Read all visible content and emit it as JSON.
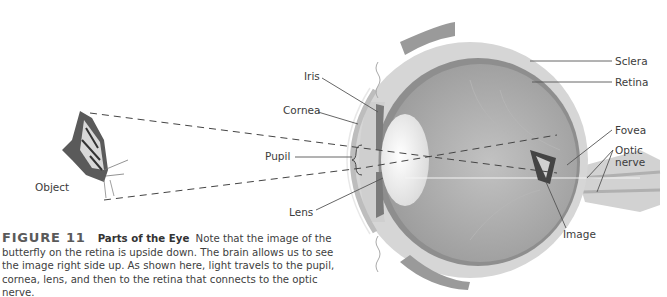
{
  "figure": {
    "number": "FIGURE 11",
    "title": "Parts of the Eye",
    "caption": "Note that the image of the butterfly on the retina is upside down. The brain allows us to see the image right side up. As shown here, light travels to the pupil, cornea, lens, and then to the retina that connects to the optic nerve."
  },
  "labels": {
    "object": "Object",
    "iris": "Iris",
    "cornea": "Cornea",
    "pupil": "Pupil",
    "lens": "Lens",
    "sclera": "Sclera",
    "retina": "Retina",
    "fovea": "Fovea",
    "optic_nerve_line1": "Optic",
    "optic_nerve_line2": "nerve",
    "image": "Image"
  },
  "colors": {
    "sclera": "#d4d4d4",
    "interior": "#a8a8a8",
    "retina_band": "#8c8c8c",
    "lens": "#efefef",
    "leader_line": "#555555",
    "text": "#3c3c3c"
  }
}
